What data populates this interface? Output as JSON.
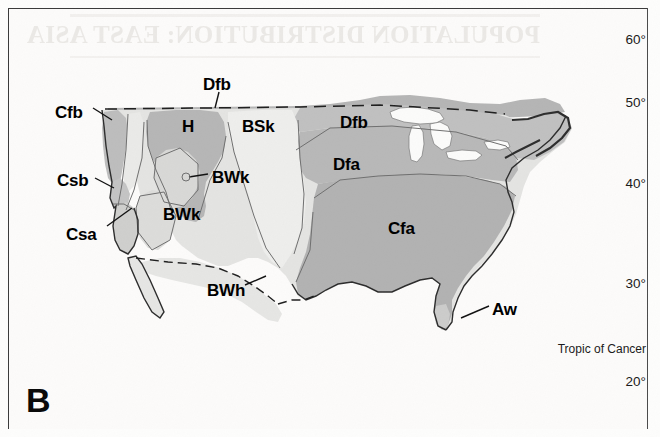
{
  "figure": {
    "panel_letter": "B",
    "bleed_through_text": "POPULATION DISTRIBUTION: EAST ASIA"
  },
  "latitude_labels": [
    {
      "text": "60°",
      "x": 612,
      "y": 32
    },
    {
      "text": "50°",
      "x": 612,
      "y": 95
    },
    {
      "text": "40°",
      "x": 612,
      "y": 176
    },
    {
      "text": "30°",
      "x": 612,
      "y": 276
    },
    {
      "text": "Tropic of Cancer",
      "x": 536,
      "y": 342
    },
    {
      "text": "20°",
      "x": 612,
      "y": 374
    }
  ],
  "zone_labels": [
    {
      "code": "Cfb",
      "x": 55,
      "y": 103,
      "leader": true
    },
    {
      "code": "Dfb",
      "x": 203,
      "y": 78,
      "leader": true
    },
    {
      "code": "H",
      "x": 182,
      "y": 118,
      "leader": false
    },
    {
      "code": "BSk",
      "x": 242,
      "y": 118,
      "leader": false
    },
    {
      "code": "Dfb",
      "x": 340,
      "y": 115,
      "leader": false
    },
    {
      "code": "Dfa",
      "x": 333,
      "y": 157,
      "leader": false
    },
    {
      "code": "Csb",
      "x": 57,
      "y": 174,
      "leader": true
    },
    {
      "code": "BWk",
      "x": 212,
      "y": 171,
      "leader": true
    },
    {
      "code": "BWk",
      "x": 163,
      "y": 208,
      "leader": false
    },
    {
      "code": "Csa",
      "x": 66,
      "y": 228,
      "leader": true
    },
    {
      "code": "Cfa",
      "x": 388,
      "y": 222,
      "leader": false
    },
    {
      "code": "BWh",
      "x": 207,
      "y": 284,
      "leader": true
    },
    {
      "code": "Aw",
      "x": 492,
      "y": 303,
      "leader": true
    }
  ],
  "colors": {
    "background": "#fdfdfc",
    "frame": "#3a3a3a",
    "zone_medium_gray": "#b4b4b4",
    "zone_light_gray": "#d2d2d2",
    "zone_pale": "#e8e8e8",
    "zone_white": "#f7f7f5",
    "coastline": "#2b2b2b",
    "zone_boundary": "#6e6e6e",
    "label_text": "#000000",
    "bleed_text": "#ebe9e6"
  }
}
